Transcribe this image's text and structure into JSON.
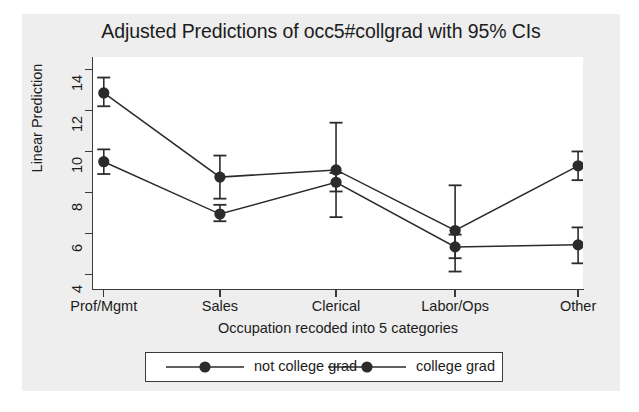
{
  "chart_data": {
    "type": "line",
    "title": "Adjusted Predictions of occ5#collgrad with 95% CIs",
    "xlabel": "Occupation recoded into 5 categories",
    "ylabel": "Linear Prediction",
    "categories": [
      "Prof/Mgmt",
      "Sales",
      "Clerical",
      "Labor/Ops",
      "Other"
    ],
    "ylim": [
      3.3,
      14.6
    ],
    "yticks": [
      4,
      6,
      8,
      10,
      12,
      14
    ],
    "ytick_labels": [
      "4",
      "6",
      "8",
      "10",
      "12",
      "14"
    ],
    "grid": false,
    "legend_position": "bottom",
    "series": [
      {
        "name": "not college grad",
        "marker": "filled-circle",
        "color": "#2b2b2b",
        "values": [
          9.5,
          6.95,
          8.5,
          5.35,
          5.45
        ],
        "ci_low": [
          8.9,
          6.6,
          8.05,
          4.8,
          4.55
        ],
        "ci_high": [
          10.1,
          7.4,
          8.95,
          5.95,
          6.3
        ]
      },
      {
        "name": "college grad",
        "marker": "filled-circle",
        "color": "#2b2b2b",
        "values": [
          12.85,
          8.75,
          9.1,
          6.15,
          9.3
        ],
        "ci_low": [
          12.2,
          7.7,
          6.8,
          4.15,
          8.6
        ],
        "ci_high": [
          13.6,
          9.8,
          11.4,
          8.35,
          10.0
        ]
      }
    ]
  },
  "legend": {
    "items": [
      {
        "label": "not college grad"
      },
      {
        "label": "college grad"
      }
    ]
  }
}
